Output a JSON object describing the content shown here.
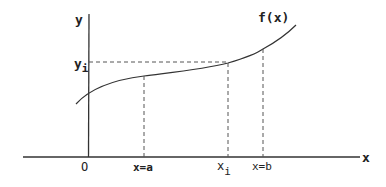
{
  "diagram": {
    "axes": {
      "x_label": "x",
      "y_label": "y",
      "origin_label": "O"
    },
    "curve": {
      "label": "f(x)"
    },
    "marks": {
      "y_i_base": "y",
      "y_i_sub": "i",
      "x_a_label": "x=a",
      "x_i_base": "x",
      "x_i_sub": "i",
      "x_b_label": "x=b"
    },
    "colors": {
      "line": "#333333",
      "dashed": "#555555",
      "text": "#222222"
    }
  }
}
